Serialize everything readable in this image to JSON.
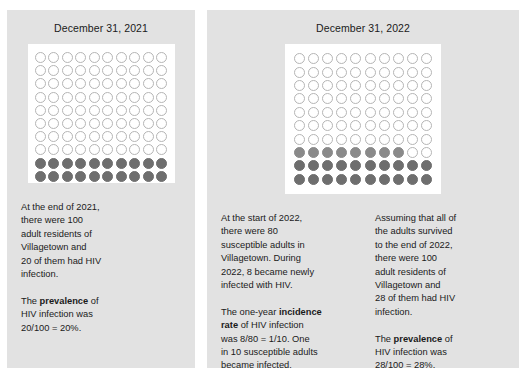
{
  "panels": [
    {
      "id": "2021",
      "title": "December 31, 2021",
      "grid": {
        "rows": 10,
        "cols": 10,
        "total": 100,
        "prevalent_count": 20,
        "incident_count": 0,
        "empty_count": 80,
        "legend": {
          "empty": "uninfected adult",
          "prevalent": "adult with HIV infection",
          "incident": "adult newly infected with HIV"
        }
      },
      "columns": [
        {
          "id": "col-2021",
          "paragraphs": [
            {
              "segments": [
                {
                  "text": "At the end of 2021,\nthere were 100\nadult residents of\nVillagetown and\n20 of them had HIV\ninfection.",
                  "bold": false
                }
              ]
            },
            {
              "segments": [
                {
                  "text": "The ",
                  "bold": false
                },
                {
                  "text": "prevalence",
                  "bold": true
                },
                {
                  "text": " of\nHIV infection was\n20/100 = 20%.",
                  "bold": false
                }
              ]
            }
          ]
        }
      ]
    },
    {
      "id": "2022",
      "title": "December 31, 2022",
      "grid": {
        "rows": 10,
        "cols": 10,
        "total": 100,
        "prevalent_count": 20,
        "incident_count": 8,
        "empty_count": 72,
        "legend": {
          "empty": "uninfected adult",
          "prevalent": "adult with HIV infection",
          "incident": "adult newly infected with HIV"
        }
      },
      "columns": [
        {
          "id": "col-2022-mid",
          "paragraphs": [
            {
              "segments": [
                {
                  "text": "At the start of 2022,\nthere were 80\nsusceptible adults in\nVillagetown. During\n2022, 8 became newly\ninfected with HIV.",
                  "bold": false
                }
              ]
            },
            {
              "segments": [
                {
                  "text": "The one-year ",
                  "bold": false
                },
                {
                  "text": "incidence\nrate",
                  "bold": true
                },
                {
                  "text": " of HIV infection\nwas 8/80 = 1/10. One\nin 10 susceptible adults\nbecame infected.",
                  "bold": false
                }
              ]
            }
          ]
        },
        {
          "id": "col-2022-right",
          "paragraphs": [
            {
              "segments": [
                {
                  "text": "Assuming that all of\nthe adults survived\nto the end of 2022,\nthere were 100\nadult residents of\nVillagetown and\n28 of them had HIV\ninfection.",
                  "bold": false
                }
              ]
            },
            {
              "segments": [
                {
                  "text": "The ",
                  "bold": false
                },
                {
                  "text": "prevalence",
                  "bold": true
                },
                {
                  "text": " of\nHIV infection was\n28/100 = 28%.",
                  "bold": false
                }
              ]
            }
          ]
        }
      ]
    }
  ],
  "colors": {
    "page_background": "#ffffff",
    "panel_background": "#e2e2e2",
    "grid_background": "#ffffff",
    "dot_empty_stroke": "#b5b5b5",
    "dot_prevalent_fill": "#6e6e6e",
    "dot_incident_fill": "#8a8a8a",
    "text": "#1a1a1a"
  }
}
